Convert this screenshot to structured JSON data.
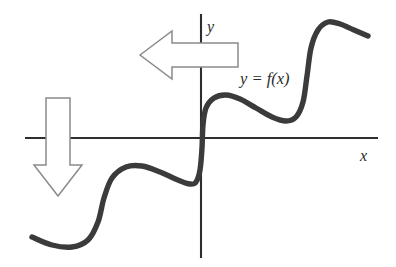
{
  "figure": {
    "background_color": "#ffffff",
    "width": 396,
    "height": 267
  },
  "labels": {
    "y_axis": "y",
    "x_axis": "x",
    "curve": "y = f(x)"
  },
  "colors": {
    "curve": "#3b3b3b",
    "axis": "#2e2e2e",
    "arrow_outline": "#8a8a8a",
    "arrow_fill": "#ffffff",
    "text": "#2b2b2b"
  },
  "chart_data": {
    "type": "line",
    "title": "",
    "xlabel": "x",
    "ylabel": "y",
    "grid": false,
    "legend": "none",
    "series": [
      {
        "name": "y = f(x)",
        "label": "y = f(x)",
        "color": "#3b3b3b",
        "shape": "increasing staircase / wavy monotone curve with three risers",
        "points_px": [
          [
            32,
            237
          ],
          [
            52,
            245
          ],
          [
            72,
            247
          ],
          [
            88,
            240
          ],
          [
            98,
            222
          ],
          [
            104,
            198
          ],
          [
            112,
            178
          ],
          [
            126,
            167
          ],
          [
            142,
            166
          ],
          [
            160,
            172
          ],
          [
            178,
            180
          ],
          [
            190,
            184
          ],
          [
            196,
            182
          ],
          [
            200,
            170
          ],
          [
            202,
            148
          ],
          [
            203,
            125
          ],
          [
            206,
            108
          ],
          [
            214,
            98
          ],
          [
            226,
            95
          ],
          [
            240,
            99
          ],
          [
            256,
            108
          ],
          [
            272,
            117
          ],
          [
            286,
            121
          ],
          [
            296,
            117
          ],
          [
            303,
            102
          ],
          [
            307,
            76
          ],
          [
            311,
            48
          ],
          [
            318,
            30
          ],
          [
            328,
            22
          ],
          [
            340,
            24
          ],
          [
            354,
            30
          ],
          [
            368,
            36
          ]
        ]
      }
    ],
    "axes_px": {
      "x_axis": {
        "x1": 25,
        "y1": 138,
        "x2": 378,
        "y2": 138
      },
      "y_axis": {
        "x1": 201,
        "y1": 14,
        "x2": 201,
        "y2": 258
      },
      "origin": [
        201,
        138
      ]
    },
    "annotations": [
      {
        "name": "left-block-arrow",
        "text": "",
        "direction": "left",
        "tip_px": [
          140,
          55
        ],
        "tail_px": [
          238,
          55
        ],
        "crosses": "y-axis"
      },
      {
        "name": "down-block-arrow",
        "text": "",
        "direction": "down",
        "tip_px": [
          58,
          196
        ],
        "tail_px": [
          58,
          98
        ],
        "crosses": "x-axis"
      },
      {
        "name": "curve-label",
        "text": "y = f(x)",
        "position_px": [
          245,
          78
        ]
      },
      {
        "name": "y-axis-label",
        "text": "y",
        "position_px": [
          207,
          26
        ]
      },
      {
        "name": "x-axis-label",
        "text": "x",
        "position_px": [
          364,
          157
        ]
      }
    ]
  }
}
